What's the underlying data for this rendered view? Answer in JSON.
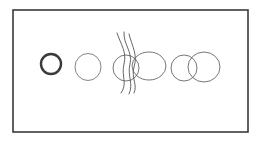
{
  "diagram": {
    "type": "hand-drawn sketch",
    "background": "#ffffff",
    "stroke_color": "#555555",
    "frame": {
      "x": 13,
      "y": 10,
      "width": 235,
      "height": 122,
      "stroke": "#3a3a3a",
      "stroke_width": 1.6
    },
    "figures": [
      {
        "name": "thick-circle",
        "shapes": [
          {
            "kind": "circle",
            "cx": 51,
            "cy": 64,
            "r": 10,
            "stroke_width": 2.4,
            "stroke": "#3a3a3a"
          }
        ]
      },
      {
        "name": "thin-circle",
        "shapes": [
          {
            "kind": "ellipse",
            "cx": 88,
            "cy": 67,
            "rx": 13,
            "ry": 13.5,
            "stroke_width": 0.9,
            "stroke": "#777777"
          }
        ]
      },
      {
        "name": "overlapping-circles-with-wavy-lines",
        "shapes": [
          {
            "kind": "ellipse",
            "cx": 126,
            "cy": 68,
            "rx": 13,
            "ry": 13,
            "stroke_width": 0.9,
            "stroke": "#666666"
          },
          {
            "kind": "ellipse",
            "cx": 149,
            "cy": 66,
            "rx": 17,
            "ry": 14,
            "stroke_width": 0.9,
            "stroke": "#666666"
          }
        ],
        "lines": [
          {
            "d": "M117 33 C121 45, 127 52, 124 64 C121 76, 128 84, 121 93",
            "stroke_width": 0.9
          },
          {
            "d": "M124 32 C123 44, 133 52, 130 64 C127 76, 134 84, 129 94",
            "stroke_width": 0.9
          },
          {
            "d": "M129 34 C132 46, 138 55, 134 67 C131 78, 138 85, 134 93",
            "stroke_width": 0.9
          }
        ]
      },
      {
        "name": "two-overlapping-circles",
        "shapes": [
          {
            "kind": "ellipse",
            "cx": 184,
            "cy": 68,
            "rx": 13,
            "ry": 13,
            "stroke_width": 0.9,
            "stroke": "#666666"
          },
          {
            "kind": "ellipse",
            "cx": 204,
            "cy": 67,
            "rx": 16,
            "ry": 15,
            "stroke_width": 0.9,
            "stroke": "#666666"
          }
        ]
      }
    ]
  }
}
